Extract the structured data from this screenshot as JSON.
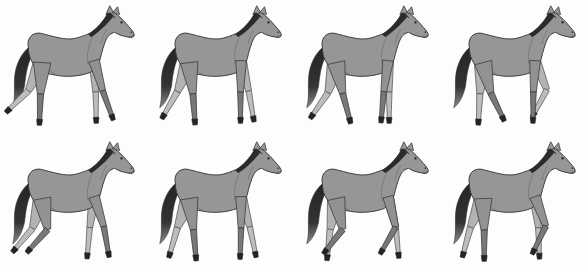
{
  "figure": {
    "name": "horse-walk-cycle-sequence",
    "rows": 2,
    "columns": 4,
    "background": "#fdfdfd"
  },
  "palette": {
    "body": "#979797",
    "outline": "#3a3a3a",
    "mane_tail_dark": "#2b2b2b",
    "tail_tip_light": "#8d8d8d",
    "near_leg_upper": "#929292",
    "near_leg_lower": "#787878",
    "far_leg_upper": "#b3b3b3",
    "far_leg_lower": "#bdbdbd",
    "hoof": "#242424",
    "contour_line": "#6f6f6f",
    "eye": "#1a1a1a"
  },
  "geometry": {
    "view": [
      150,
      130
    ],
    "hip_pivot": [
      43,
      60
    ],
    "shoulder_pivot": [
      96,
      58
    ],
    "upper_leg_length": 32,
    "lower_leg_length": 26,
    "hoof_length": 6,
    "hind_widths": [
      9,
      3.2,
      2.1
    ],
    "front_widths": [
      5.5,
      2.9,
      2.0
    ]
  },
  "frames": [
    {
      "name": "walk-phase-1",
      "row": 1,
      "col": 1,
      "legs": {
        "hind_far": [
          -26,
          -46
        ],
        "hind_near": [
          -3,
          -2
        ],
        "front_far": [
          3,
          1
        ],
        "front_near": [
          16,
          20
        ]
      }
    },
    {
      "name": "walk-phase-2",
      "row": 1,
      "col": 2,
      "legs": {
        "hind_far": [
          -22,
          -30
        ],
        "hind_near": [
          7,
          4
        ],
        "front_far": [
          14,
          10
        ],
        "front_near": [
          -1,
          0
        ]
      }
    },
    {
      "name": "walk-phase-3",
      "row": 1,
      "col": 3,
      "legs": {
        "hind_far": [
          -15,
          -35
        ],
        "hind_near": [
          12,
          15
        ],
        "front_far": [
          2,
          0
        ],
        "front_near": [
          -8,
          -5
        ]
      }
    },
    {
      "name": "walk-phase-4",
      "row": 1,
      "col": 4,
      "legs": {
        "hind_far": [
          -6,
          -3
        ],
        "hind_near": [
          14,
          26
        ],
        "front_far": [
          22,
          -28
        ],
        "front_near": [
          -3,
          -1
        ]
      }
    },
    {
      "name": "walk-phase-5",
      "row": 2,
      "col": 1,
      "legs": {
        "hind_far": [
          -18,
          -40
        ],
        "hind_near": [
          10,
          -42
        ],
        "front_far": [
          -8,
          -5
        ],
        "front_near": [
          18,
          10
        ]
      }
    },
    {
      "name": "walk-phase-6",
      "row": 2,
      "col": 2,
      "legs": {
        "hind_far": [
          -22,
          -16
        ],
        "hind_near": [
          8,
          5
        ],
        "front_far": [
          16,
          12
        ],
        "front_near": [
          0,
          -2
        ]
      }
    },
    {
      "name": "walk-phase-7",
      "row": 2,
      "col": 3,
      "legs": {
        "hind_far": [
          -11,
          -6
        ],
        "hind_near": [
          12,
          -38
        ],
        "front_far": [
          14,
          6
        ],
        "front_near": [
          14,
          -30
        ]
      }
    },
    {
      "name": "walk-phase-8",
      "row": 2,
      "col": 4,
      "legs": {
        "hind_far": [
          -24,
          -15
        ],
        "hind_near": [
          2,
          0
        ],
        "front_far": [
          6,
          2
        ],
        "front_near": [
          20,
          -26
        ]
      }
    }
  ]
}
